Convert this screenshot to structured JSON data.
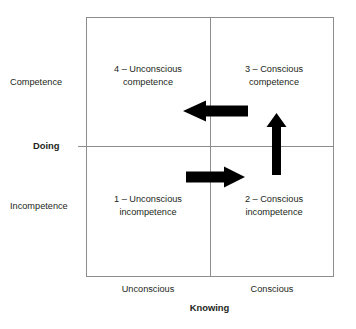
{
  "diagram": {
    "background_color": "#ffffff",
    "line_color": "#8d8d8d",
    "text_color": "#231f20",
    "arrow_color": "#000000"
  },
  "axes": {
    "x": {
      "title": "Knowing",
      "ticks": [
        "Unconscious",
        "Conscious"
      ]
    },
    "y": {
      "title": "Doing",
      "ticks": [
        "Competence",
        "Incompetence"
      ]
    }
  },
  "quadrants": [
    {
      "id": "quadrant-4",
      "number": "4",
      "line1": "4 – Unconscious",
      "line2": "competence",
      "position": "top-left"
    },
    {
      "id": "quadrant-3",
      "number": "3",
      "line1": "3 – Conscious",
      "line2": "competence",
      "position": "top-right"
    },
    {
      "id": "quadrant-1",
      "number": "1",
      "line1": "1 – Unconscious",
      "line2": "incompetence",
      "position": "bottom-left"
    },
    {
      "id": "quadrant-2",
      "number": "2",
      "line1": "2 – Conscious",
      "line2": "incompetence",
      "position": "bottom-right"
    }
  ],
  "arrows": [
    {
      "id": "arrow-1-to-2",
      "direction": "right",
      "from": "1 – Unconscious incompetence",
      "to": "2 – Conscious incompetence"
    },
    {
      "id": "arrow-2-to-3",
      "direction": "up",
      "from": "2 – Conscious incompetence",
      "to": "3 – Conscious competence"
    },
    {
      "id": "arrow-3-to-4",
      "direction": "left",
      "from": "3 – Conscious competence",
      "to": "4 – Unconscious competence"
    }
  ]
}
